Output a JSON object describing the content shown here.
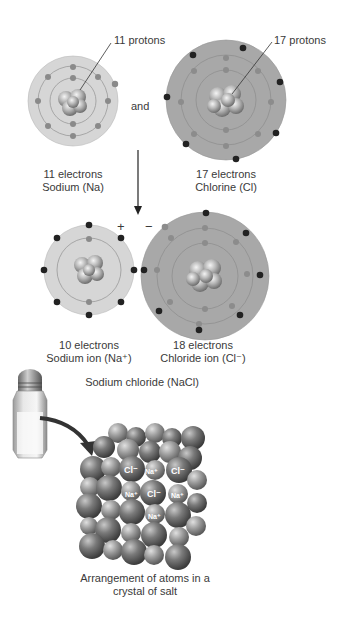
{
  "atoms": {
    "sodium": {
      "protons_label": "11 protons",
      "electrons_label": "11 electrons",
      "name_label": "Sodium (Na)"
    },
    "connector": "and",
    "chlorine": {
      "protons_label": "17 protons",
      "electrons_label": "17 electrons",
      "name_label": "Chlorine (Cl)"
    }
  },
  "ions": {
    "sodium_ion": {
      "charge": "+",
      "electrons_label": "10 electrons",
      "name_label": "Sodium ion (Na⁺)"
    },
    "chloride_ion": {
      "charge": "−",
      "electrons_label": "18 electrons",
      "name_label": "Chloride ion (Cl⁻)"
    }
  },
  "compound": {
    "title": "Sodium chloride (NaCl)",
    "crystal_labels": [
      "Cl⁻",
      "Na⁺",
      "Cl⁻",
      "Na⁺",
      "Cl⁻",
      "Na⁺",
      "Na⁺"
    ],
    "caption_line1": "Arrangement of atoms in a",
    "caption_line2": "crystal of salt"
  },
  "colors": {
    "na_disk": "#d6d6d6",
    "cl_disk": "#a8a8a8",
    "inner_electron": "#8a8a8a",
    "outer_electron": "#222222",
    "sphere": "#6a6a6a"
  }
}
